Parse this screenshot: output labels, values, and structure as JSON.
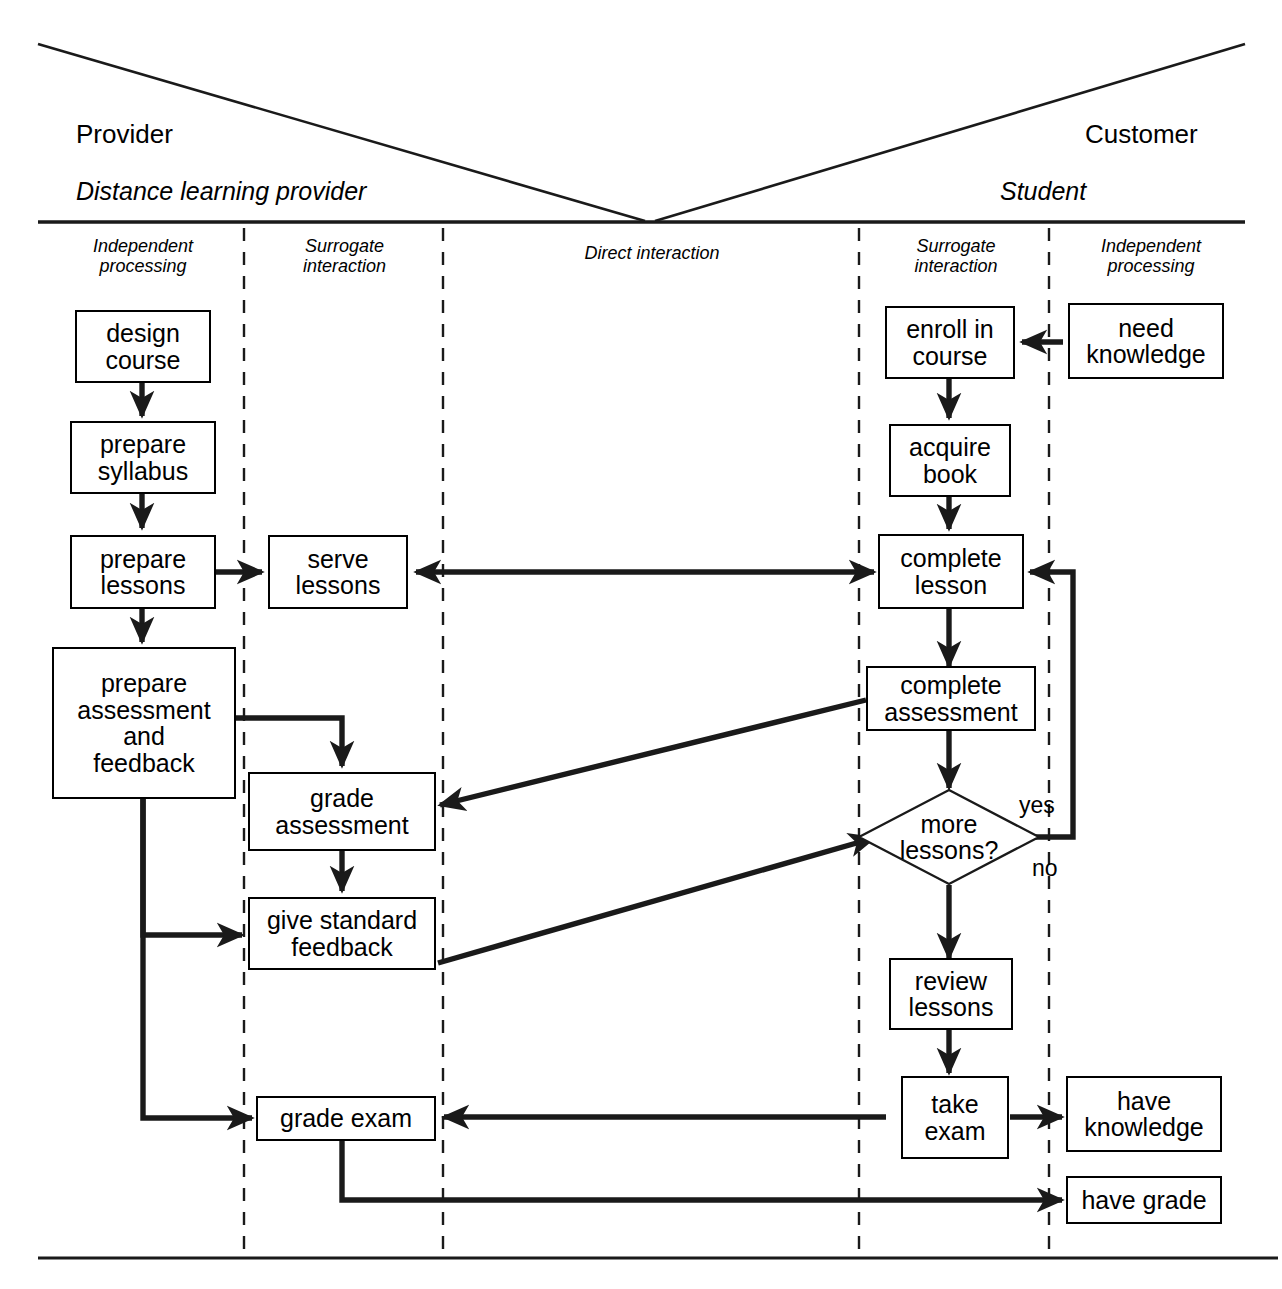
{
  "diagram": {
    "roles": [
      {
        "key": "provider",
        "label": "Provider"
      },
      {
        "key": "customer",
        "label": "Customer"
      }
    ],
    "actors": [
      {
        "key": "provider_actor",
        "label": "Distance learning provider"
      },
      {
        "key": "customer_actor",
        "label": "Student"
      }
    ],
    "zones": [
      {
        "key": "provider_independent",
        "label": "Independent\nprocessing"
      },
      {
        "key": "provider_surrogate",
        "label": "Surrogate\ninteraction"
      },
      {
        "key": "direct",
        "label": "Direct interaction"
      },
      {
        "key": "customer_surrogate",
        "label": "Surrogate\ninteraction"
      },
      {
        "key": "customer_independent",
        "label": "Independent\nprocessing"
      }
    ],
    "nodes": [
      {
        "key": "design_course",
        "label": "design\ncourse"
      },
      {
        "key": "prepare_syllabus",
        "label": "prepare\nsyllabus"
      },
      {
        "key": "prepare_lessons",
        "label": "prepare\nlessons"
      },
      {
        "key": "prepare_assessment_and_feedback",
        "label": "prepare\nassessment\nand\nfeedback"
      },
      {
        "key": "serve_lessons",
        "label": "serve\nlessons"
      },
      {
        "key": "grade_assessment",
        "label": "grade\nassessment"
      },
      {
        "key": "give_standard_feedback",
        "label": "give standard\nfeedback"
      },
      {
        "key": "grade_exam",
        "label": "grade exam"
      },
      {
        "key": "enroll_in_course",
        "label": "enroll in\ncourse"
      },
      {
        "key": "acquire_book",
        "label": "acquire\nbook"
      },
      {
        "key": "complete_lesson",
        "label": "complete\nlesson"
      },
      {
        "key": "complete_assessment",
        "label": "complete\nassessment"
      },
      {
        "key": "more_lessons",
        "label": "more\nlessons?"
      },
      {
        "key": "review_lessons",
        "label": "review\nlessons"
      },
      {
        "key": "take_exam",
        "label": "take\nexam"
      },
      {
        "key": "have_knowledge",
        "label": "have\nknowledge"
      },
      {
        "key": "have_grade",
        "label": "have grade"
      },
      {
        "key": "need_knowledge",
        "label": "need\nknowledge"
      }
    ],
    "edge_labels": [
      {
        "key": "yes",
        "label": "yes"
      },
      {
        "key": "no",
        "label": "no"
      }
    ],
    "colors": {
      "line": "#1a1a1a",
      "node_border": "#000000",
      "background": "#ffffff"
    }
  }
}
